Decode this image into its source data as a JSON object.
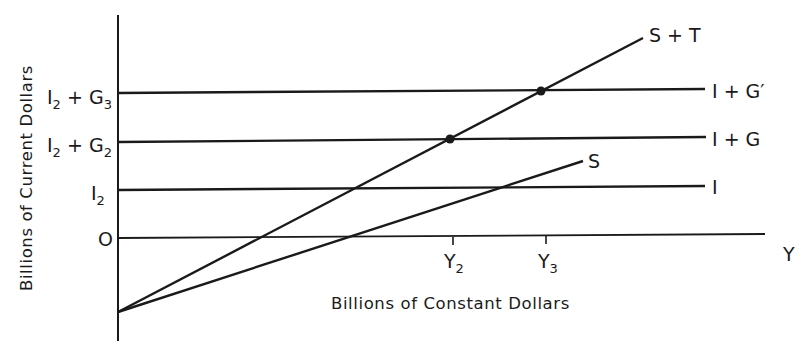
{
  "diagram": {
    "type": "economics-income-determination",
    "y_axis_title": "Billions of Current Dollars",
    "x_axis_title": "Billions of Constant Dollars",
    "x_axis_end_label": "Y",
    "y_levels": [
      {
        "label_main": "I",
        "label_sub": "2",
        "label_rest": " + G",
        "label_rest_sub": "3",
        "line_label": "I + G′"
      },
      {
        "label_main": "I",
        "label_sub": "2",
        "label_rest": " + G",
        "label_rest_sub": "2",
        "line_label": "I + G"
      },
      {
        "label_main": "I",
        "label_sub": "2",
        "label_rest": "",
        "label_rest_sub": "",
        "line_label": "I"
      },
      {
        "label_main": "O",
        "label_sub": "",
        "label_rest": "",
        "label_rest_sub": "",
        "line_label": ""
      }
    ],
    "curves": [
      {
        "name": "S + T",
        "label": "S + T"
      },
      {
        "name": "S",
        "label": "S"
      }
    ],
    "x_ticks": [
      {
        "main": "Y",
        "sub": "2"
      },
      {
        "main": "Y",
        "sub": "3"
      }
    ],
    "equilibria": [
      {
        "curve": "S + T",
        "line": "I + G",
        "at": "Y2"
      },
      {
        "curve": "S + T",
        "line": "I + G′",
        "at": "Y3"
      }
    ]
  }
}
